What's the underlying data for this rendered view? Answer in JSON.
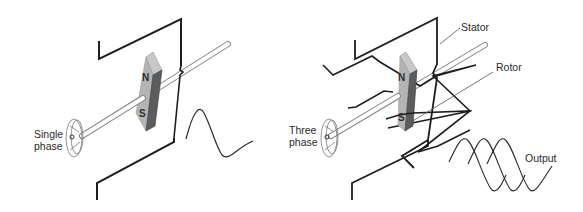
{
  "colors": {
    "wire": "#1e1e1e",
    "shaft_stroke": "#8a8a8a",
    "magnet_face": "#b4b4b4",
    "magnet_top": "#c8c8c8",
    "magnet_side": "#5c5c5c",
    "leader": "#555555"
  },
  "left_panel": {
    "name": "single-phase-generator",
    "input_label_line1": "Single",
    "input_label_line2": "phase",
    "magnet": {
      "north": "N",
      "south": "S"
    },
    "output_waveform": "single sine cycle"
  },
  "right_panel": {
    "name": "three-phase-generator",
    "input_label_line1": "Three",
    "input_label_line2": "phase",
    "magnet": {
      "north": "N",
      "south": "S"
    },
    "callouts": {
      "stator": "Stator",
      "rotor": "Rotor",
      "output": "Output"
    },
    "output_waveform": "three overlapping sine waves (120° phase offset)"
  }
}
